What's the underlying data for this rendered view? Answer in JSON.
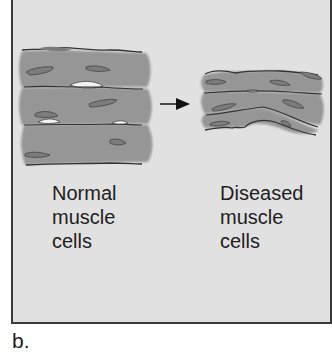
{
  "figure": {
    "panel_letter": "b.",
    "colors": {
      "background": "#e1e1e1",
      "cell_fill": "#9a9a9a",
      "nucleus_fill": "#7c7c7c",
      "outline": "#333333",
      "gap_fill": "#f2f2f2"
    },
    "normal": {
      "label_lines": [
        "Normal",
        "muscle",
        "cells"
      ]
    },
    "diseased": {
      "label_lines": [
        "Diseased",
        "muscle",
        "cells"
      ]
    },
    "arrow": {
      "direction": "right",
      "meaning": "progression from normal to diseased"
    }
  }
}
